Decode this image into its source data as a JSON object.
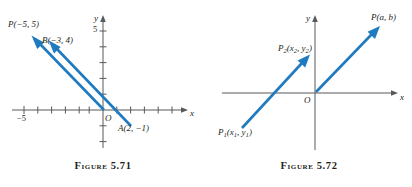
{
  "page": {
    "width": 412,
    "height": 187,
    "background": "#ffffff",
    "line_color": "#1f7ac0",
    "axis_color": "#58595b",
    "text_color": "#231f20"
  },
  "figures": [
    {
      "id": "figure-5-71",
      "caption": "Figure 5.71",
      "axes": {
        "x_label": "x",
        "y_label": "y",
        "origin_label": "O",
        "x_ticks": [
          "",
          "",
          "",
          "",
          "",
          "",
          "",
          "",
          "",
          ""
        ],
        "x_tick_labels": [
          {
            "text": "−5",
            "value": -5
          }
        ],
        "y_tick_labels": [
          {
            "text": "5",
            "value": 5
          }
        ]
      },
      "points": [
        {
          "name": "P",
          "label": "P(−5, 5)"
        },
        {
          "name": "B",
          "label": "B(−3, 4)"
        },
        {
          "name": "A",
          "label": "A(2, −1)"
        }
      ],
      "vectors": [
        {
          "name": "vector-OP",
          "from": [
            0,
            0
          ],
          "to": [
            -5,
            5
          ]
        },
        {
          "name": "vector-AB",
          "from": [
            2,
            -1
          ],
          "to": [
            -3,
            4
          ]
        }
      ]
    },
    {
      "id": "figure-5-72",
      "caption": "Figure 5.72",
      "axes": {
        "x_label": "x",
        "y_label": "y",
        "origin_label": "O"
      },
      "points": [
        {
          "name": "P",
          "label_parts": [
            "P(a, b)"
          ],
          "label": "P(a, b)"
        },
        {
          "name": "P2",
          "label": "P₂(x₂, y₂)",
          "base": "P",
          "sub": "2",
          "body": "(x",
          "sub2": "2",
          "mid": ", y",
          "sub3": "2",
          "tail": ")"
        },
        {
          "name": "P1",
          "label": "P₁(x₁, y₁)",
          "base": "P",
          "sub": "1",
          "body": "(x",
          "sub2": "1",
          "mid": ", y",
          "sub3": "1",
          "tail": ")"
        }
      ],
      "vectors": [
        {
          "name": "vector-OP",
          "from": [
            0,
            0
          ],
          "to": [
            5.1,
            5.0
          ]
        },
        {
          "name": "vector-P1P2",
          "from": [
            -5.5,
            -4.0
          ],
          "to": [
            -1.0,
            1.1
          ]
        }
      ]
    }
  ]
}
